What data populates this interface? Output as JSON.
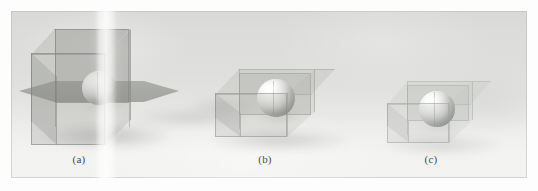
{
  "figure": {
    "kind": "scanned-photographic-figure",
    "background_color": "#fdfdfd",
    "plate_color": "#dedfdc",
    "panel_count": 3,
    "alt_description": "Three renderings of a glossy sphere enclosed in a semi-transparent rectangular glass box, shown at three different box proportions."
  },
  "panels": [
    {
      "id": "panel-a",
      "caption": "(a)",
      "object": "cube-with-sphere",
      "box_shape": "tall cube with intersecting horizontal plane",
      "sphere_color": "#e8e8e6",
      "glass_color": "#969894"
    },
    {
      "id": "panel-b",
      "caption": "(b)",
      "object": "box-with-sphere",
      "box_shape": "wide flat rectangular box",
      "sphere_color": "#ececea",
      "glass_color": "#a8aaa6"
    },
    {
      "id": "panel-c",
      "caption": "(c)",
      "object": "box-with-sphere",
      "box_shape": "small wide rectangular box",
      "sphere_color": "#eeeeec",
      "glass_color": "#b4b6b2"
    }
  ]
}
